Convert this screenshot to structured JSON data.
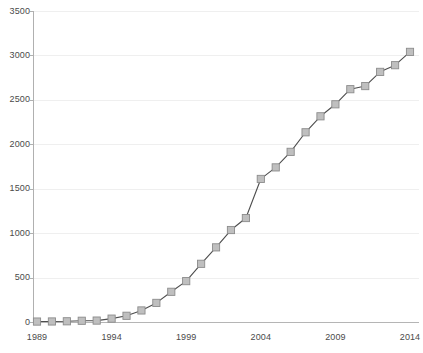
{
  "chart_data": {
    "type": "line",
    "title": "",
    "subtitle": "",
    "xlabel": "",
    "ylabel": "",
    "xlim": [
      1989,
      2014
    ],
    "ylim": [
      0,
      3500
    ],
    "y_ticks": [
      0,
      500,
      1000,
      1500,
      2000,
      2500,
      3000,
      3500
    ],
    "y_tick_labels": [
      "0",
      "500",
      "1000",
      "1500",
      "2000",
      "2500",
      "3000",
      "3500"
    ],
    "x_ticks": [
      1989,
      1994,
      1999,
      2004,
      2009,
      2014
    ],
    "x_tick_labels": [
      "1989",
      "1994",
      "1999",
      "2004",
      "2009",
      "2014"
    ],
    "grid": "horizontal",
    "legend": "none",
    "marker": "square",
    "marker_color": "#bfbfbf",
    "marker_edge_color": "#8c8c8c",
    "line_color": "#4d4d4d",
    "gridline_color": "#efefef",
    "axis_color": "#b0b0b0",
    "x": [
      1989,
      1990,
      1991,
      1992,
      1993,
      1994,
      1995,
      1996,
      1997,
      1998,
      1999,
      2000,
      2001,
      2002,
      2003,
      2004,
      2005,
      2006,
      2007,
      2008,
      2009,
      2010,
      2011,
      2012,
      2013,
      2014
    ],
    "values": [
      5,
      6,
      8,
      14,
      16,
      38,
      70,
      130,
      215,
      340,
      460,
      655,
      840,
      1035,
      1170,
      1610,
      1740,
      1915,
      2135,
      2315,
      2450,
      2620,
      2655,
      2815,
      2890,
      3040
    ],
    "series": [
      {
        "name": "series-1",
        "values": [
          5,
          6,
          8,
          14,
          16,
          38,
          70,
          130,
          215,
          340,
          460,
          655,
          840,
          1035,
          1170,
          1610,
          1740,
          1915,
          2135,
          2315,
          2450,
          2620,
          2655,
          2815,
          2890,
          3040
        ]
      }
    ]
  }
}
